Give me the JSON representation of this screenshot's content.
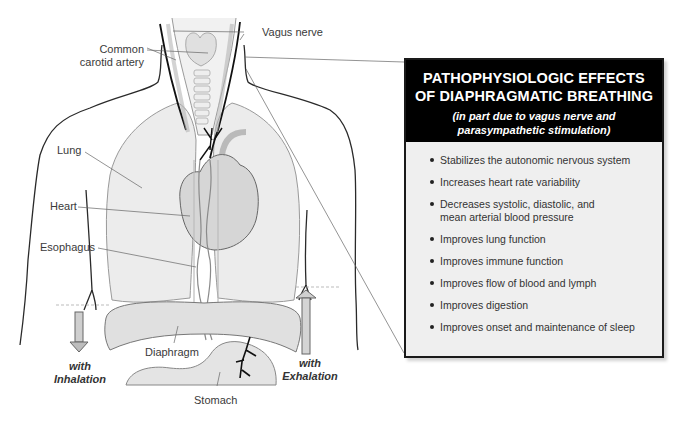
{
  "diagram": {
    "labels": {
      "vagus_nerve": "Vagus nerve",
      "common_carotid_line1": "Common",
      "common_carotid_line2": "carotid artery",
      "lung": "Lung",
      "heart": "Heart",
      "esophagus": "Esophagus",
      "diaphragm": "Diaphragm",
      "stomach": "Stomach"
    },
    "breathing": {
      "inhalation_line1": "with",
      "inhalation_line2": "Inhalation",
      "exhalation_line1": "with",
      "exhalation_line2": "Exhalation",
      "inhalation_arrow": "down",
      "exhalation_arrow": "up"
    }
  },
  "info_box": {
    "title_line1": "PATHOPHYSIOLOGIC EFFECTS",
    "title_line2": "OF DIAPHRAGMATIC BREATHING",
    "subtitle_line1": "(in part due to vagus nerve and",
    "subtitle_line2": "parasympathetic stimulation)",
    "effects": [
      "Stabilizes the autonomic nervous system",
      "Increases heart rate variability",
      "Decreases systolic, diastolic, and mean arterial blood pressure",
      "Improves lung function",
      "Improves immune function",
      "Improves flow of blood and lymph",
      "Improves digestion",
      "Improves onset and maintenance of sleep"
    ]
  },
  "colors": {
    "header_bg": "#000000",
    "box_bg": "#efefef",
    "organ_fill": "#e6e6e6",
    "nerve": "#111111"
  }
}
